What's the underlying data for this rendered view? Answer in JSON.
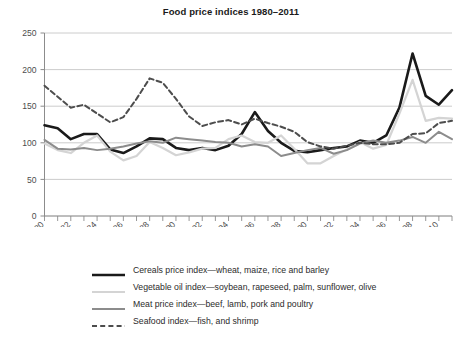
{
  "chart": {
    "title": "Food price indices 1980–2011"
  },
  "axes": {
    "y_ticks": [
      "0",
      "50",
      "100",
      "150",
      "200",
      "250"
    ],
    "x_ticks": [
      "1980",
      "1982",
      "1984",
      "1986",
      "1988",
      "1990",
      "1992",
      "1994",
      "1996",
      "1998",
      "2000",
      "2002",
      "2004",
      "2006",
      "2008",
      "2010"
    ]
  },
  "legend": {
    "items": [
      {
        "label": "Cereals price index—wheat, maize, rice and barley",
        "color": "#1a1a1a",
        "style": "solid",
        "width": 2.6
      },
      {
        "label": "Vegetable oil index—soybean, rapeseed, palm, sunflower, olive",
        "color": "#d4d4d4",
        "style": "solid",
        "width": 2.2
      },
      {
        "label": "Meat price index—beef, lamb, pork and poultry",
        "color": "#8c8c8c",
        "style": "solid",
        "width": 2.0
      },
      {
        "label": "Seafood index—fish, and shrimp",
        "color": "#4d4d4d",
        "style": "dashed",
        "width": 2.0
      }
    ]
  },
  "chart_data": {
    "type": "line",
    "title": "Food price indices 1980–2011",
    "xlabel": "",
    "ylabel": "",
    "xlim": [
      1980,
      2011
    ],
    "ylim": [
      0,
      250
    ],
    "grid": true,
    "legend_position": "bottom",
    "x": [
      1980,
      1981,
      1982,
      1983,
      1984,
      1985,
      1986,
      1987,
      1988,
      1989,
      1990,
      1991,
      1992,
      1993,
      1994,
      1995,
      1996,
      1997,
      1998,
      1999,
      2000,
      2001,
      2002,
      2003,
      2004,
      2005,
      2006,
      2007,
      2008,
      2009,
      2010,
      2011
    ],
    "series": [
      {
        "name": "Cereals price index—wheat, maize, rice and barley",
        "color": "#1a1a1a",
        "style": "solid",
        "values": [
          124,
          120,
          105,
          112,
          112,
          91,
          86,
          95,
          106,
          105,
          93,
          90,
          93,
          90,
          96,
          112,
          142,
          116,
          100,
          89,
          87,
          90,
          93,
          95,
          103,
          100,
          110,
          148,
          222,
          164,
          152,
          172
        ]
      },
      {
        "name": "Vegetable oil index—soybean, rapeseed, palm, sunflower, olive",
        "color": "#d4d4d4",
        "style": "solid",
        "values": [
          99,
          90,
          86,
          100,
          110,
          88,
          76,
          82,
          101,
          93,
          83,
          87,
          92,
          93,
          105,
          110,
          101,
          100,
          110,
          92,
          72,
          72,
          82,
          91,
          101,
          92,
          97,
          140,
          186,
          130,
          134,
          133
        ]
      },
      {
        "name": "Meat price index—beef, lamb, pork and poultry",
        "color": "#8c8c8c",
        "style": "solid",
        "values": [
          104,
          92,
          91,
          93,
          90,
          92,
          95,
          99,
          102,
          100,
          107,
          105,
          103,
          101,
          100,
          95,
          98,
          95,
          82,
          86,
          90,
          93,
          85,
          90,
          99,
          103,
          100,
          103,
          108,
          100,
          115,
          105
        ]
      },
      {
        "name": "Seafood index—fish, and shrimp",
        "color": "#4d4d4d",
        "style": "dashed",
        "values": [
          178,
          163,
          148,
          152,
          140,
          128,
          135,
          160,
          188,
          182,
          160,
          136,
          123,
          128,
          131,
          125,
          133,
          127,
          122,
          115,
          101,
          95,
          92,
          96,
          100,
          98,
          98,
          100,
          112,
          113,
          127,
          130
        ]
      }
    ]
  }
}
